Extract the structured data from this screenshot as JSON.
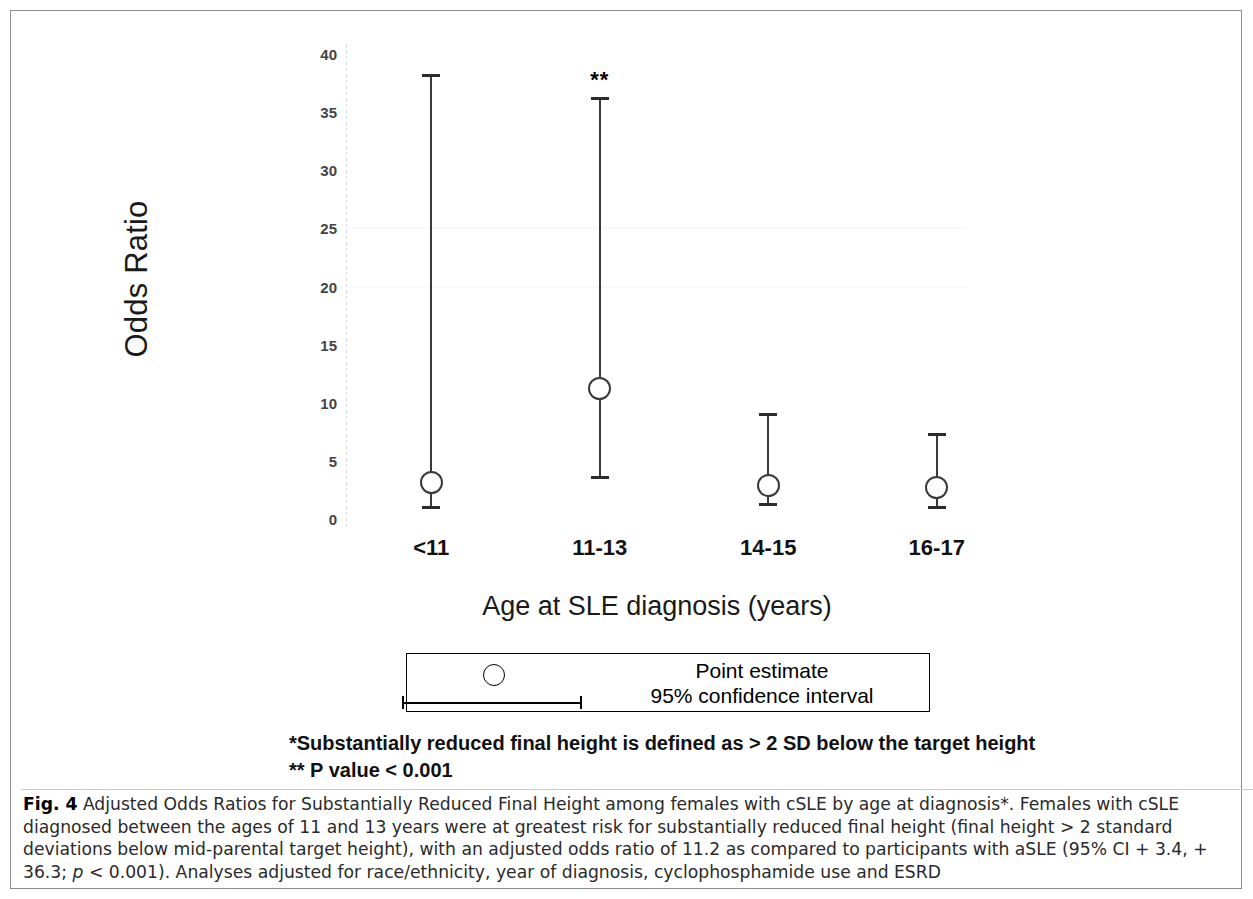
{
  "figure": {
    "y_axis_label": "Odds Ratio",
    "x_axis_label": "Age at SLE diagnosis (years)"
  },
  "legend": {
    "point_estimate_label": "Point estimate",
    "ci_label": "95% confidence interval"
  },
  "footnotes": {
    "line1": "*Substantially reduced final height is defined as > 2 SD below the target height",
    "line2": "** P value < 0.001"
  },
  "caption": {
    "figure_number": "Fig. 4",
    "text": " Adjusted Odds Ratios for Substantially Reduced Final Height among females with cSLE by age at diagnosis*. Females with cSLE diagnosed between the ages of 11 and 13 years were at greatest risk for substantially reduced final height (final height > 2 standard deviations below mid-parental target height), with an adjusted odds ratio of 11.2 as compared to participants with aSLE (95% CI + 3.4, + 36.3; ",
    "p_italic": "p",
    "text_end": " < 0.001). Analyses adjusted for race/ethnicity, year of diagnosis, cyclophosphamide use and ESRD"
  },
  "chart_data": {
    "type": "scatter",
    "title": "Adjusted Odds Ratios for Substantially Reduced Final Height among females with cSLE by age at diagnosis",
    "xlabel": "Age at SLE diagnosis (years)",
    "ylabel": "Odds Ratio",
    "ylim": [
      0,
      40
    ],
    "yticks": [
      0,
      5,
      10,
      15,
      20,
      25,
      30,
      35,
      40
    ],
    "grid": false,
    "legend_position": "below-plot",
    "categories": [
      "<11",
      "11-13",
      "14-15",
      "16-17"
    ],
    "series": [
      {
        "name": "Adjusted Odds Ratio (point estimate with 95% CI)",
        "values": [
          3.1,
          11.2,
          2.9,
          2.7
        ],
        "ci_lower": [
          0.9,
          3.4,
          1.1,
          0.9
        ],
        "ci_upper": [
          38.3,
          36.3,
          9.1,
          7.4
        ],
        "annotations": [
          "",
          "**",
          "",
          ""
        ]
      }
    ]
  }
}
